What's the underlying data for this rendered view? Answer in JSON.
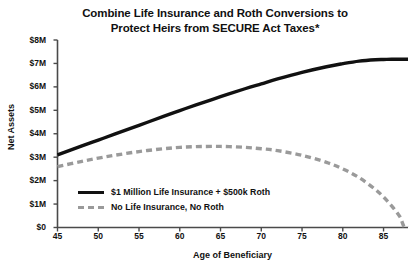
{
  "chart_data": {
    "type": "line",
    "title": "Combine Life Insurance and Roth Conversions to Protect Heirs from SECURE Act Taxes*",
    "title_line1": "Combine Life Insurance and Roth Conversions to",
    "title_line2": "Protect Heirs from SECURE Act Taxes*",
    "xlabel": "Age of Beneficiary",
    "ylabel": "Net Assets",
    "xlim": [
      45,
      88
    ],
    "ylim": [
      0,
      8
    ],
    "y_unit": "millions_usd",
    "grid": false,
    "legend_position": "inside-lower-left",
    "xticks": [
      45,
      50,
      55,
      60,
      65,
      70,
      75,
      80,
      85
    ],
    "xtick_labels": [
      "45",
      "50",
      "55",
      "60",
      "65",
      "70",
      "75",
      "80",
      "85"
    ],
    "yticks": [
      0,
      1,
      2,
      3,
      4,
      5,
      6,
      7,
      8
    ],
    "ytick_labels": [
      "$0",
      "$1M",
      "$2M",
      "$3M",
      "$4M",
      "$5M",
      "$6M",
      "$7M",
      "$8M"
    ],
    "x": [
      45,
      48,
      50,
      52,
      55,
      58,
      60,
      62,
      65,
      68,
      70,
      72,
      75,
      78,
      80,
      82,
      84,
      85,
      86,
      87,
      87.5,
      88
    ],
    "series": [
      {
        "name": "$1 Million Life Insurance + $500k Roth",
        "style": "solid",
        "color": "#111111",
        "values": [
          3.1,
          3.48,
          3.73,
          3.98,
          4.36,
          4.74,
          4.99,
          5.23,
          5.58,
          5.92,
          6.13,
          6.34,
          6.62,
          6.86,
          6.99,
          7.1,
          7.16,
          7.17,
          7.18,
          7.18,
          7.18,
          7.18
        ]
      },
      {
        "name": "No Life Insurance, No Roth",
        "style": "dashed",
        "color": "#9a9a9a",
        "values": [
          2.6,
          2.82,
          2.96,
          3.08,
          3.24,
          3.36,
          3.42,
          3.45,
          3.46,
          3.42,
          3.36,
          3.28,
          3.08,
          2.78,
          2.5,
          2.13,
          1.62,
          1.3,
          0.92,
          0.46,
          0.05,
          0.0
        ]
      }
    ]
  }
}
